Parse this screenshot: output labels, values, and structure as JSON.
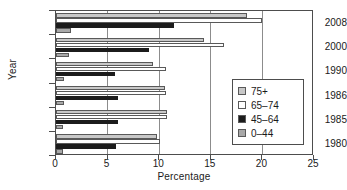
{
  "chart_data": {
    "type": "bar",
    "orientation": "horizontal",
    "title": "",
    "xlabel": "Percentage",
    "ylabel": "Year",
    "xlim": [
      0,
      25
    ],
    "ylim": null,
    "grid": true,
    "grid_axis": "x",
    "legend_position": "right",
    "categories": [
      "2008",
      "2000",
      "1990",
      "1986",
      "1985",
      "1980"
    ],
    "xticks": [
      "0",
      "5",
      "10",
      "15",
      "20",
      "25"
    ],
    "series": [
      {
        "name": "75+",
        "color": "#c8c8c8",
        "values": [
          18.5,
          14.3,
          9.4,
          10.6,
          10.8,
          9.8
        ]
      },
      {
        "name": "65–74",
        "color": "#ffffff",
        "values": [
          20.0,
          16.3,
          10.7,
          10.7,
          10.8,
          10.1
        ]
      },
      {
        "name": "45–64",
        "color": "#1c1c1c",
        "values": [
          11.4,
          9.0,
          5.7,
          6.0,
          6.0,
          5.8
        ]
      },
      {
        "name": "0–44",
        "color": "#a8a8a8",
        "values": [
          1.5,
          1.3,
          0.8,
          0.8,
          0.7,
          0.7
        ]
      }
    ]
  },
  "legend": {
    "items": [
      {
        "label": "75+"
      },
      {
        "label": "65–74"
      },
      {
        "label": "45–64"
      },
      {
        "label": "0–44"
      }
    ]
  }
}
